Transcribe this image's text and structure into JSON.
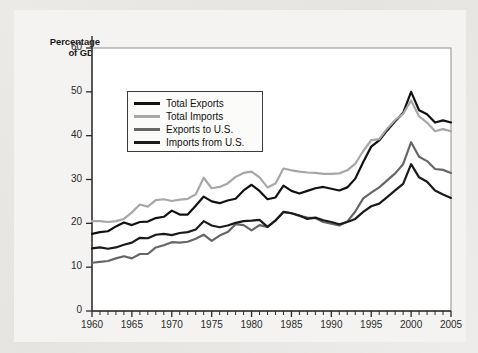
{
  "chart_data": {
    "type": "line",
    "title": "",
    "xlabel": "",
    "ylabel": "Percentage of GDP",
    "ylabel_line1": "Percentage",
    "ylabel_line2": "of GDP",
    "xlim": [
      1960,
      2005
    ],
    "ylim": [
      0,
      60
    ],
    "yticks": [
      0,
      10,
      20,
      30,
      40,
      50,
      60
    ],
    "xticks": [
      1960,
      1965,
      1970,
      1975,
      1980,
      1985,
      1990,
      1995,
      2000,
      2005
    ],
    "xtick_labels": [
      "1960",
      "1965",
      "1970",
      "1975",
      "1980",
      "1985",
      "1990",
      "1995",
      "2000",
      "2005"
    ],
    "ytick_labels": [
      "0",
      "10",
      "20",
      "30",
      "40",
      "50",
      "60"
    ],
    "minor_xtick_step": 1,
    "grid": false,
    "legend_position": "upper-left-inside",
    "x": [
      1960,
      1961,
      1962,
      1963,
      1964,
      1965,
      1966,
      1967,
      1968,
      1969,
      1970,
      1971,
      1972,
      1973,
      1974,
      1975,
      1976,
      1977,
      1978,
      1979,
      1980,
      1981,
      1982,
      1983,
      1984,
      1985,
      1986,
      1987,
      1988,
      1989,
      1990,
      1991,
      1992,
      1993,
      1994,
      1995,
      1996,
      1997,
      1998,
      1999,
      2000,
      2001,
      2002,
      2003,
      2004,
      2005
    ],
    "series": [
      {
        "name": "Total Exports",
        "color": "#111111",
        "width": 2.2,
        "values": [
          17.6,
          18.0,
          18.2,
          19.3,
          20.2,
          19.6,
          20.3,
          20.4,
          21.2,
          21.5,
          22.9,
          22.0,
          22.0,
          24.0,
          26.1,
          25.0,
          24.6,
          25.2,
          25.6,
          27.5,
          28.8,
          27.4,
          25.5,
          25.9,
          28.6,
          27.4,
          26.8,
          27.4,
          28.0,
          28.3,
          27.9,
          27.5,
          28.2,
          30.2,
          34.0,
          37.5,
          38.9,
          41.2,
          43.3,
          45.2,
          50.0,
          45.8,
          44.9,
          43.0,
          43.5,
          43.0
        ]
      },
      {
        "name": "Total Imports",
        "color": "#a7a7a7",
        "width": 2.2,
        "values": [
          20.5,
          20.5,
          20.3,
          20.5,
          21.0,
          22.5,
          24.3,
          23.8,
          25.3,
          25.5,
          25.1,
          25.4,
          25.6,
          26.6,
          30.4,
          28.0,
          28.3,
          29.1,
          30.6,
          31.5,
          31.8,
          30.5,
          28.2,
          29.1,
          32.5,
          32.1,
          31.8,
          31.6,
          31.5,
          31.3,
          31.3,
          31.4,
          32.1,
          33.6,
          36.5,
          39.0,
          39.2,
          41.6,
          43.6,
          45.0,
          48.0,
          44.4,
          43.0,
          41.0,
          41.5,
          41.0
        ]
      },
      {
        "name": "Exports to U.S.",
        "color": "#666666",
        "width": 2.2,
        "values": [
          11.0,
          11.2,
          11.4,
          12.0,
          12.5,
          12.0,
          13.0,
          13.0,
          14.5,
          15.0,
          15.7,
          15.6,
          15.8,
          16.5,
          17.4,
          16.0,
          17.2,
          18.0,
          19.8,
          19.6,
          18.4,
          19.6,
          19.2,
          20.7,
          22.6,
          22.3,
          21.7,
          21.3,
          21.2,
          20.3,
          19.9,
          19.5,
          20.4,
          22.7,
          25.7,
          27.0,
          28.2,
          29.8,
          31.4,
          33.5,
          38.5,
          35.2,
          34.2,
          32.4,
          32.2,
          31.5
        ]
      },
      {
        "name": "Imports from U.S.",
        "color": "#1a1a1a",
        "width": 2.2,
        "values": [
          14.3,
          14.5,
          14.2,
          14.5,
          15.1,
          15.6,
          16.7,
          16.6,
          17.4,
          17.6,
          17.3,
          17.8,
          18.0,
          18.6,
          20.5,
          19.5,
          19.1,
          19.5,
          20.1,
          20.5,
          20.6,
          20.8,
          19.2,
          20.6,
          22.6,
          22.3,
          21.8,
          21.0,
          21.3,
          20.7,
          20.3,
          19.8,
          20.3,
          21.0,
          22.6,
          23.9,
          24.5,
          26.0,
          27.5,
          29.0,
          33.5,
          30.5,
          29.5,
          27.5,
          26.6,
          25.8
        ]
      }
    ],
    "legend": [
      {
        "label": "Total Exports",
        "color": "#111111"
      },
      {
        "label": "Total Imports",
        "color": "#a7a7a7"
      },
      {
        "label": "Exports to U.S.",
        "color": "#666666"
      },
      {
        "label": "Imports from U.S.",
        "color": "#1a1a1a"
      }
    ]
  }
}
